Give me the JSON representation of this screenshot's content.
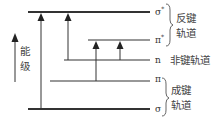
{
  "diagram": {
    "type": "energy-level-diagram",
    "axis": {
      "label": "能级",
      "label_chars": [
        "能",
        "级"
      ]
    },
    "levels": [
      {
        "id": "sigma_star",
        "label": "σ",
        "superscript": "*",
        "y": 12,
        "x1": 28,
        "x2": 150
      },
      {
        "id": "pi_star",
        "label": "π",
        "superscript": "*",
        "y": 40,
        "x1": 88,
        "x2": 150
      },
      {
        "id": "n",
        "label": "n",
        "superscript": "",
        "y": 60,
        "x1": 64,
        "x2": 150
      },
      {
        "id": "pi",
        "label": "π",
        "superscript": "",
        "y": 81,
        "x1": 50,
        "x2": 150
      },
      {
        "id": "sigma",
        "label": "σ",
        "superscript": "",
        "y": 109,
        "x1": 28,
        "x2": 150
      }
    ],
    "transitions": [
      {
        "name": "σ→σ*",
        "from": "sigma",
        "to": "sigma_star",
        "x": 41
      },
      {
        "name": "n→σ*",
        "from": "n",
        "to": "sigma_star",
        "x": 68
      },
      {
        "name": "π→π*",
        "from": "pi",
        "to": "pi_star",
        "x": 96
      },
      {
        "name": "n→π*",
        "from": "n",
        "to": "pi_star",
        "x": 120
      }
    ],
    "groups": [
      {
        "id": "antibonding",
        "label_line1": "反键",
        "label_line2": "轨道",
        "levels": [
          "sigma_star",
          "pi_star"
        ]
      },
      {
        "id": "nonbonding",
        "label": "非键轨道",
        "levels": [
          "n"
        ]
      },
      {
        "id": "bonding",
        "label_line1": "成键",
        "label_line2": "轨道",
        "levels": [
          "pi",
          "sigma"
        ]
      }
    ],
    "colors": {
      "line": "#333333",
      "text": "#444444",
      "background": "#ffffff"
    }
  }
}
